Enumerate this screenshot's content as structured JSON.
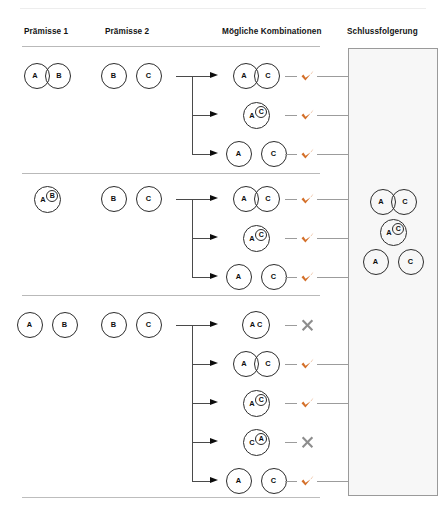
{
  "colors": {
    "tick": "#d4702a",
    "cross": "#8d8d8d",
    "rule": "#b9b9b9",
    "panel_bg": "#f7f7f7",
    "panel_border": "#9a9a9a",
    "circle_stroke": "#2c2c2c",
    "connector": "#4a4a4a"
  },
  "headers": {
    "premise1": "Prämisse 1",
    "premise2": "Prämisse 2",
    "combinations": "Mögliche Kombinationen",
    "conclusion": "Schlussfolgerung"
  },
  "labels": {
    "a": "A",
    "b": "B",
    "c": "C",
    "ac": "A C"
  },
  "marks": {
    "valid": "✔",
    "invalid": "✘"
  },
  "rows": [
    {
      "id": "row-1",
      "premise1": {
        "kind": "overlap",
        "left": "A",
        "right": "B"
      },
      "premise2": {
        "kind": "disjoint",
        "left": "B",
        "right": "C"
      },
      "combinations": [
        {
          "kind": "overlap",
          "left": "A",
          "right": "C",
          "verdict": "valid"
        },
        {
          "kind": "nested",
          "outer": "A",
          "inner": "C",
          "verdict": "valid"
        },
        {
          "kind": "disjoint",
          "left": "A",
          "right": "C",
          "verdict": "valid"
        }
      ]
    },
    {
      "id": "row-2",
      "premise1": {
        "kind": "nested",
        "outer": "A",
        "inner": "B"
      },
      "premise2": {
        "kind": "disjoint",
        "left": "B",
        "right": "C"
      },
      "combinations": [
        {
          "kind": "overlap",
          "left": "A",
          "right": "C",
          "verdict": "valid"
        },
        {
          "kind": "nested",
          "outer": "A",
          "inner": "C",
          "verdict": "valid"
        },
        {
          "kind": "disjoint",
          "left": "A",
          "right": "C",
          "verdict": "valid"
        }
      ]
    },
    {
      "id": "row-3",
      "premise1": {
        "kind": "disjoint",
        "left": "A",
        "right": "B"
      },
      "premise2": {
        "kind": "disjoint",
        "left": "B",
        "right": "C"
      },
      "combinations": [
        {
          "kind": "identical",
          "label": "A C",
          "verdict": "invalid"
        },
        {
          "kind": "overlap",
          "left": "A",
          "right": "C",
          "verdict": "valid"
        },
        {
          "kind": "nested",
          "outer": "A",
          "inner": "C",
          "verdict": "valid"
        },
        {
          "kind": "nested",
          "outer": "C",
          "inner": "A",
          "verdict": "invalid"
        },
        {
          "kind": "disjoint",
          "left": "A",
          "right": "C",
          "verdict": "valid"
        }
      ]
    }
  ],
  "conclusion": {
    "diagrams": [
      {
        "kind": "overlap",
        "left": "A",
        "right": "C"
      },
      {
        "kind": "nested",
        "outer": "A",
        "inner": "C"
      },
      {
        "kind": "disjoint",
        "left": "A",
        "right": "C"
      }
    ]
  }
}
